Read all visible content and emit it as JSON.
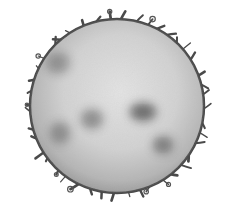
{
  "image": {
    "subject": "Sun illustration",
    "description": "Grayscale drawing of the Sun showing a mottled disk with dark sunspots and flame-like prominences around the limb",
    "background": "#ffffff",
    "disk": {
      "cx": 117,
      "cy": 106,
      "r": 87,
      "center_color": "#e2e2e2",
      "mid_color": "#cfcfcf",
      "edge_color": "#9a9a9a",
      "rim_color": "#4a4a4a"
    },
    "sunspots": [
      {
        "cx": 143,
        "cy": 112,
        "rx": 14,
        "ry": 10,
        "opacity": 0.55
      },
      {
        "cx": 92,
        "cy": 119,
        "rx": 12,
        "ry": 11,
        "opacity": 0.35
      },
      {
        "cx": 163,
        "cy": 145,
        "rx": 11,
        "ry": 10,
        "opacity": 0.4
      },
      {
        "cx": 58,
        "cy": 63,
        "rx": 13,
        "ry": 12,
        "opacity": 0.28
      },
      {
        "cx": 60,
        "cy": 133,
        "rx": 11,
        "ry": 12,
        "opacity": 0.3
      }
    ],
    "prominence_count": 44
  }
}
